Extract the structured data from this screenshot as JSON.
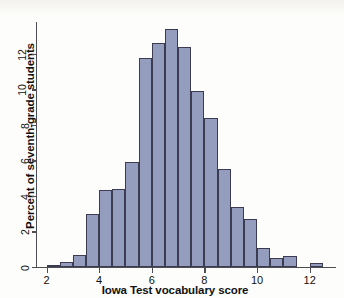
{
  "figure": {
    "ylabel": "Percent of seventh-grade students",
    "xlabel": "Iowa Test vocabulary score"
  },
  "colors": {
    "bar_fill": "#959dbe",
    "bar_edge": "#3b3b52",
    "axis": "#4e4e52",
    "background": "#fdfdfb",
    "text": "#111111"
  },
  "chart_data": {
    "type": "bar",
    "title": "",
    "subtitle": "",
    "xlabel": "Iowa Test vocabulary score",
    "ylabel": "Percent of seventh-grade students",
    "grid": false,
    "legend": null,
    "bin_width": 0.5,
    "xlim": [
      1.6,
      13.0
    ],
    "ylim": [
      0,
      13.8
    ],
    "xticks": [
      2,
      4,
      6,
      8,
      10,
      12
    ],
    "yticks": [
      0,
      2,
      4,
      6,
      8,
      10,
      12
    ],
    "xtick_labels": [
      "2",
      "4",
      "6",
      "8",
      "10",
      "12"
    ],
    "ytick_labels": [
      "0",
      "2",
      "4",
      "6",
      "8",
      "10",
      "12"
    ],
    "categories": [
      "2.0-2.5",
      "2.5-3.0",
      "3.0-3.5",
      "3.5-4.0",
      "4.0-4.5",
      "4.5-5.0",
      "5.0-5.5",
      "5.5-6.0",
      "6.0-6.5",
      "6.5-7.0",
      "7.0-7.5",
      "7.5-8.0",
      "8.0-8.5",
      "8.5-9.0",
      "9.0-9.5",
      "9.5-10.0",
      "10.0-10.5",
      "10.5-11.0",
      "11.0-11.5",
      "12.0-12.5"
    ],
    "bin_starts": [
      2.0,
      2.5,
      3.0,
      3.5,
      4.0,
      4.5,
      5.0,
      5.5,
      6.0,
      6.5,
      7.0,
      7.5,
      8.0,
      8.5,
      9.0,
      9.5,
      10.0,
      10.5,
      11.0,
      12.0
    ],
    "values": [
      0.1,
      0.3,
      0.7,
      3.0,
      4.35,
      4.4,
      5.9,
      11.8,
      12.6,
      13.4,
      12.4,
      9.9,
      8.4,
      5.5,
      3.4,
      2.7,
      1.05,
      0.5,
      0.6,
      0.2
    ]
  }
}
